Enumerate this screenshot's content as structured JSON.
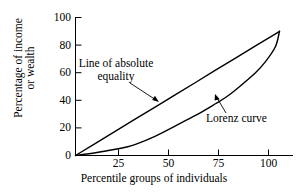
{
  "chart_data": {
    "type": "line",
    "title": "",
    "xlabel": "Percentile groups of individuals",
    "ylabel_line1": "Percentage of income",
    "ylabel_line2": "or wealth",
    "xlim": [
      0,
      110
    ],
    "ylim": [
      0,
      100
    ],
    "xticks": [
      25,
      50,
      75,
      100
    ],
    "xtick_labels": [
      "25",
      "50",
      "75",
      "100"
    ],
    "yticks": [
      0,
      20,
      40,
      60,
      80,
      100
    ],
    "ytick_labels": [
      "0",
      "20",
      "40",
      "60",
      "80",
      "100"
    ],
    "grid": false,
    "legend_position": "none",
    "line_color": "#000000",
    "axis_color": "#000000",
    "background": "#ffffff",
    "series": [
      {
        "name": "Line of absolute equality",
        "annotation": "Line of absolute equality",
        "annotation_point": [
          46,
          41
        ],
        "x": [
          0,
          10,
          20,
          30,
          40,
          50,
          60,
          70,
          80,
          90,
          100,
          102
        ],
        "y": [
          0,
          8.8,
          17.6,
          26.5,
          35.3,
          44.1,
          52.9,
          61.8,
          70.6,
          79.4,
          88.2,
          90
        ]
      },
      {
        "name": "Lorenz curve",
        "annotation": "Lorenz curve",
        "annotation_point": [
          76,
          45
        ],
        "x": [
          0,
          10,
          20,
          25,
          30,
          40,
          50,
          60,
          70,
          75,
          80,
          90,
          95,
          100,
          102
        ],
        "y": [
          0,
          2.0,
          4.5,
          6.0,
          8.0,
          14.0,
          21.5,
          29.0,
          37.5,
          42.0,
          47.5,
          60.0,
          68.0,
          79.0,
          90
        ]
      }
    ],
    "annotations": [
      {
        "text_line1": "Line of absolute",
        "text_line2": "equality",
        "arrow_from": [
          130,
          83
        ],
        "arrow_to": [
          159,
          102
        ]
      },
      {
        "text_line1": "Lorenz curve",
        "text_line2": "",
        "arrow_from": [
          226,
          113
        ],
        "arrow_to": [
          215,
          94
        ]
      }
    ]
  }
}
